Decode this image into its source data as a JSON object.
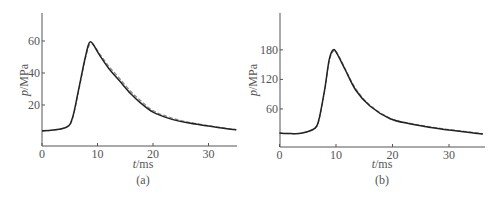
{
  "figure": {
    "panels": [
      {
        "label": "(a)"
      },
      {
        "label": "(b)"
      }
    ]
  },
  "colors": {
    "solid": "#222222",
    "dashed": "#888888",
    "axis": "#555555"
  },
  "chart_data": [
    {
      "type": "line",
      "panel": "(a)",
      "title": "",
      "xlabel": "t/ms",
      "ylabel": "p/MPa",
      "xlim": [
        0,
        35
      ],
      "ylim": [
        -6,
        78
      ],
      "xticks": [
        0,
        10,
        20,
        30
      ],
      "yticks": [
        20,
        40,
        60
      ],
      "grid": false,
      "legend": null,
      "series": [
        {
          "name": "solid",
          "style": "solid",
          "x": [
            0,
            2,
            4.5,
            5.5,
            6.5,
            7.5,
            8.3,
            8.7,
            9.2,
            10.4,
            12,
            14,
            16,
            17.7,
            20,
            23,
            26,
            30,
            33,
            35
          ],
          "y": [
            3.8,
            4.3,
            6.3,
            12,
            28,
            45,
            57,
            59.5,
            58,
            51,
            43,
            35,
            27,
            21.5,
            15.5,
            11.5,
            9,
            6.8,
            5.3,
            4.5
          ]
        },
        {
          "name": "dashed",
          "style": "dashed",
          "x": [
            0,
            2,
            4.5,
            5.5,
            6.5,
            7.5,
            8.3,
            8.8,
            9.4,
            10.4,
            12,
            14,
            16,
            17.7,
            20,
            23,
            26,
            30,
            33,
            35
          ],
          "y": [
            3.8,
            4.3,
            6.3,
            11.5,
            27,
            44,
            55.5,
            58,
            57,
            52,
            44.5,
            36.5,
            28.5,
            23,
            16.5,
            12.3,
            9.5,
            7.1,
            5.5,
            4.6
          ]
        }
      ]
    },
    {
      "type": "line",
      "panel": "(b)",
      "title": "",
      "xlabel": "t/ms",
      "ylabel": "p/MPa",
      "xlim": [
        0,
        36
      ],
      "ylim": [
        -17,
        220
      ],
      "xticks": [
        0,
        10,
        20,
        30
      ],
      "yticks": [
        60,
        120,
        180
      ],
      "grid": false,
      "legend": null,
      "series": [
        {
          "name": "solid",
          "style": "solid",
          "x": [
            0,
            2,
            4,
            6.3,
            7,
            8,
            8.8,
            9.5,
            10.2,
            11.7,
            13.5,
            16,
            19.6,
            23,
            26,
            30,
            33,
            36
          ],
          "y": [
            11,
            10,
            11,
            21,
            40,
            100,
            160,
            180,
            172,
            138,
            98,
            66,
            40,
            30,
            24,
            17,
            13,
            9
          ]
        },
        {
          "name": "dashed",
          "style": "dashed",
          "x": [
            0,
            2,
            4,
            6.3,
            7,
            8,
            8.8,
            9.6,
            10.3,
            11.7,
            13.5,
            16,
            19.6,
            23,
            26,
            30,
            33,
            36
          ],
          "y": [
            11,
            10,
            11,
            21,
            38,
            97,
            157,
            178,
            172,
            140,
            101,
            68,
            41,
            31,
            25,
            18,
            14,
            10
          ]
        }
      ]
    }
  ]
}
